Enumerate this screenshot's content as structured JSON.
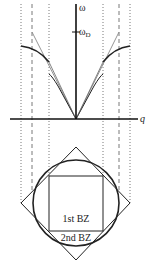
{
  "diagram": {
    "axes": {
      "y_label": "ω",
      "x_label": "q",
      "tick_label": "ω",
      "tick_label_sub": "D"
    },
    "zones": {
      "first": "1st BZ",
      "second": "2nd BZ"
    },
    "colors": {
      "axis": "#111111",
      "dispersion": "#222222",
      "linear": "#8a8a8a",
      "guides": "#444444",
      "shapes": "#222222"
    }
  }
}
